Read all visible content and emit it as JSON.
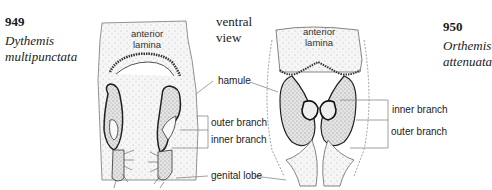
{
  "figures": [
    {
      "number": "949",
      "genus": "Dythemis",
      "species": "multipunctata"
    },
    {
      "number": "950",
      "genus": "Orthemis",
      "species": "attenuata"
    }
  ],
  "view_label": {
    "line1": "ventral",
    "line2": "view"
  },
  "structure_labels": {
    "anterior_lamina_left": {
      "line1": "anterior",
      "line2": "lamina"
    },
    "anterior_lamina_right": {
      "line1": "anterior",
      "line2": "lamina"
    },
    "hamule": "hamule",
    "outer_branch_left": "outer branch",
    "inner_branch_left": "inner branch",
    "genital_lobe": "genital lobe",
    "inner_branch_right": "inner branch",
    "outer_branch_right": "outer branch"
  },
  "colors": {
    "ink": "#222222",
    "stipple": "#9a9a9a",
    "leader": "#888888",
    "fill": "#ececec"
  }
}
